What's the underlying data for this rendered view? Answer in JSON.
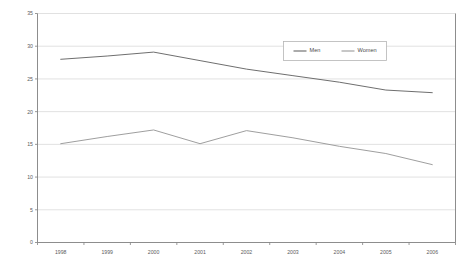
{
  "chart_data": {
    "type": "line",
    "title": "",
    "subtitle": "",
    "xlabel": "",
    "ylabel": "",
    "categories": [
      "1998",
      "1999",
      "2000",
      "2001",
      "2002",
      "2003",
      "2004",
      "2005",
      "2006"
    ],
    "series": [
      {
        "name": "Men",
        "color": "#666666",
        "values": [
          28.0,
          28.5,
          29.1,
          27.8,
          26.5,
          25.5,
          24.5,
          23.3,
          22.9
        ]
      },
      {
        "name": "Women",
        "color": "#999999",
        "values": [
          15.1,
          16.2,
          17.2,
          15.1,
          17.1,
          16.0,
          14.7,
          13.6,
          11.9
        ]
      }
    ],
    "ylim": [
      0,
      35
    ],
    "ytick_step": 5,
    "yticks": [
      "0",
      "5",
      "10",
      "15",
      "20",
      "25",
      "30",
      "35"
    ],
    "grid": true,
    "grid_color": "#d9d9d9",
    "axis_color": "#808080",
    "legend_position": "top-center-right",
    "legend_entries": [
      "Men",
      "Women"
    ],
    "background": "#ffffff"
  }
}
